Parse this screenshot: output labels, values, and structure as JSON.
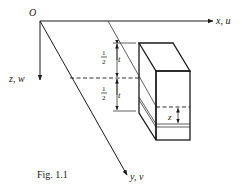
{
  "figure": {
    "caption": "Fig. 1.1",
    "origin_label": "O",
    "axes": {
      "x": "x, u",
      "y": "y, v",
      "z": "z, w"
    },
    "dimensions": {
      "upper_half_numerator": "1",
      "upper_half_denominator": "2",
      "upper_half_var": "t",
      "lower_half_numerator": "1",
      "lower_half_denominator": "2",
      "lower_half_var": "t",
      "layer_offset": "z"
    },
    "colors": {
      "ink": "#1a1a1a",
      "background": "#ffffff"
    }
  }
}
